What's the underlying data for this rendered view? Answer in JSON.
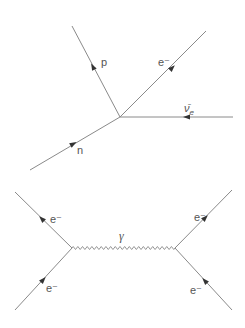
{
  "diagrams": [
    {
      "name": "beta-decay",
      "vertex": [
        120,
        117
      ],
      "particles": [
        {
          "label": "p",
          "from": [
            120,
            117
          ],
          "to": [
            72,
            26
          ],
          "arrow_at": [
            93,
            67
          ],
          "arrow_dir": "outgoing",
          "label_pos": [
            101,
            64
          ]
        },
        {
          "label": "e⁻",
          "from": [
            120,
            117
          ],
          "to": [
            206,
            31
          ],
          "arrow_at": [
            172,
            68
          ],
          "arrow_dir": "outgoing",
          "label_pos": [
            158,
            64
          ]
        },
        {
          "label": "ν̄e",
          "label_main": "ν̄",
          "label_sub": "e",
          "from": [
            233,
            117
          ],
          "to": [
            120,
            117
          ],
          "arrow_at": [
            187,
            117
          ],
          "arrow_dir": "incoming",
          "label_pos": [
            184,
            111
          ]
        },
        {
          "label": "n",
          "from": [
            30,
            170
          ],
          "to": [
            120,
            117
          ],
          "arrow_at": [
            73,
            144
          ],
          "arrow_dir": "incoming",
          "label_pos": [
            77,
            153
          ]
        }
      ]
    },
    {
      "name": "electron-scattering",
      "vertices": [
        [
          72,
          248
        ],
        [
          175,
          248
        ]
      ],
      "particles": [
        {
          "label": "e⁻",
          "from": [
            72,
            248
          ],
          "to": [
            15,
            192
          ],
          "arrow_at": [
            42,
            219
          ],
          "label_pos": [
            52,
            221
          ]
        },
        {
          "label": "e⁻",
          "from": [
            15,
            310
          ],
          "to": [
            72,
            248
          ],
          "arrow_at": [
            43,
            280
          ],
          "label_pos": [
            47,
            290
          ]
        },
        {
          "label": "e⁻",
          "from": [
            175,
            248
          ],
          "to": [
            232,
            190
          ],
          "arrow_at": [
            205,
            218
          ],
          "label_pos": [
            194,
            219
          ]
        },
        {
          "label": "e⁻",
          "from": [
            175,
            248
          ],
          "to": [
            232,
            310
          ],
          "arrow_at": [
            205,
            281
          ],
          "label_pos": [
            190,
            292
          ]
        }
      ],
      "propagator": {
        "label": "γ",
        "from": [
          72,
          248
        ],
        "to": [
          175,
          248
        ],
        "cycles": 22,
        "label_pos": [
          120,
          240
        ]
      }
    }
  ],
  "labels": {
    "proton": "p",
    "electron": "e⁻",
    "antineutrino_main": "ν̄",
    "antineutrino_sub": "e",
    "neutron": "n",
    "photon": "γ"
  }
}
